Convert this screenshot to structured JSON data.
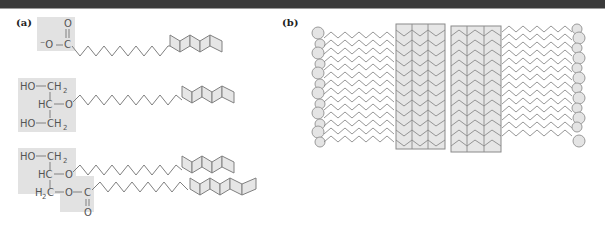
{
  "panels": {
    "a": {
      "label": "(a)",
      "molecules": [
        {
          "name": "cholesterol-like fatty acid anion",
          "groups": {
            "carbonyl_o": "O",
            "anion_o": "⁻O",
            "c": "C"
          }
        },
        {
          "name": "monoalkyl glycerol ether",
          "groups": {
            "row1_ho": "HO",
            "row1_ch": "CH",
            "row1_sub": "2",
            "row2_hc": "HC",
            "row2_o": "O",
            "row3_ho": "HO",
            "row3_ch": "CH",
            "row3_sub": "2"
          }
        },
        {
          "name": "alkyl acyl glycerol",
          "groups": {
            "row1_ho": "HO",
            "row1_ch": "CH",
            "row1_sub": "2",
            "row2_hc": "HC",
            "row2_o": "O",
            "row3_h": "H",
            "row3_sub": "2",
            "row3_c": "C",
            "row3_o": "O",
            "ester_c": "C",
            "ester_o": "O"
          }
        }
      ]
    },
    "b": {
      "label": "(b)",
      "description": "bilayer of lipid chains with ring-like blocks",
      "headgroup_rows": 10
    }
  },
  "colors": {
    "line": "#808080",
    "shade": "#e2e2e2",
    "ring_fill": "#e6e6e6",
    "topbar": "#3a3a3a"
  }
}
